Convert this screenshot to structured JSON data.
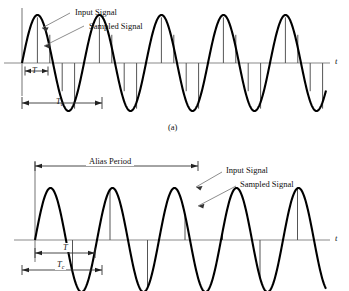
{
  "figure": {
    "axis_label": "t",
    "caption_a": "(a)",
    "colors": {
      "signal": "#000000",
      "axis": "#808080",
      "sample": "#555555",
      "leader": "#666666",
      "background": "#ffffff"
    }
  },
  "panel_a": {
    "name": "adequately-sampled-signal",
    "labels": {
      "input_signal": "Input Signal",
      "sampled_signal": "Sampled Signal",
      "sample_period": "T",
      "signal_period": "T",
      "signal_period_sub": "c",
      "axis": "t"
    },
    "caption": "(a)"
  },
  "panel_b": {
    "name": "undersampled-aliased-signal",
    "labels": {
      "alias_period": "Alias Period",
      "input_signal": "Input Signal",
      "sampled_signal": "Sampled Signal",
      "sample_period": "T",
      "signal_period": "T",
      "signal_period_sub": "c",
      "axis": "t"
    }
  },
  "chart_data": {
    "type": "line",
    "xlabel": "t",
    "ylabel": "",
    "panels": [
      {
        "id": "a",
        "caption": "(a)",
        "description": "Input sine wave sampled at a rate well above the signal frequency; samples track the waveform.",
        "signal": {
          "name": "Input Signal",
          "waveform": "sine",
          "amplitude": 1.0,
          "period_px": 62,
          "cycles": 4.6,
          "phase": 0
        },
        "sampling": {
          "name": "Sampled Signal",
          "sample_interval_px": 12.4,
          "samples_per_cycle": 5,
          "count": 25
        },
        "annotations": [
          {
            "label": "T",
            "type": "dimension",
            "meaning": "sample interval",
            "x_start_px": 25,
            "x_end_px": 48
          },
          {
            "label": "Tc",
            "type": "dimension",
            "meaning": "signal period",
            "x_start_px": 22,
            "x_end_px": 102
          }
        ]
      },
      {
        "id": "b",
        "caption": "",
        "description": "Same signal undersampled; the samples describe a much lower frequency alias waveform.",
        "signal": {
          "name": "Input Signal",
          "waveform": "sine",
          "amplitude": 1.0,
          "period_px": 62,
          "cycles": 4.6,
          "phase": 0
        },
        "sampling": {
          "name": "Sampled Signal",
          "sample_interval_px": 37.5,
          "samples_per_cycle": 1.65,
          "count": 8
        },
        "annotations": [
          {
            "label": "Alias Period",
            "type": "dimension",
            "x_start_px": 35,
            "x_end_px": 198
          },
          {
            "label": "T",
            "type": "dimension",
            "meaning": "sample interval",
            "x_start_px": 35,
            "x_end_px": 95
          },
          {
            "label": "Tc",
            "type": "dimension",
            "meaning": "signal period",
            "x_start_px": 22,
            "x_end_px": 102
          }
        ]
      }
    ]
  }
}
